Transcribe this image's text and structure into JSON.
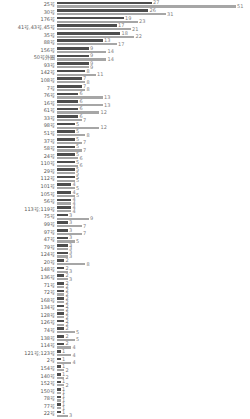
{
  "chart_data": {
    "type": "bar",
    "orientation": "horizontal",
    "title": "",
    "xlabel": "",
    "ylabel": "",
    "xlim": [
      0,
      55
    ],
    "grid": false,
    "legend": "none",
    "value_labels": true,
    "categories": [
      "25号",
      "30号",
      "176号",
      "41号,43号,45号",
      "35号",
      "88号",
      "156号",
      "50号外圈",
      "93号",
      "142号",
      "108号",
      "7号",
      "76号",
      "16号",
      "61号",
      "33号",
      "98号",
      "51号",
      "37号",
      "58号",
      "24号",
      "110号",
      "29号",
      "112号",
      "101号",
      "105号",
      "56号",
      "113号;119号",
      "75号",
      "99号",
      "97号",
      "47号",
      "79号",
      "124号",
      "20号",
      "148号",
      "136号",
      "71号",
      "72号",
      "168号",
      "134号",
      "128号",
      "126号",
      "74号",
      "138号",
      "114号",
      "121号;123号",
      "2号",
      "154号",
      "140号",
      "152号",
      "150号",
      "78号",
      "77号",
      "22号"
    ],
    "series": [
      {
        "name": "series-1-dark",
        "color": "#4d4d4d",
        "values": [
          27,
          26,
          19,
          17,
          18,
          13,
          9,
          9,
          9,
          8,
          7,
          7,
          6,
          6,
          6,
          6,
          5,
          5,
          5,
          5,
          5,
          5,
          5,
          5,
          4,
          4,
          4,
          4,
          3,
          3,
          3,
          3,
          3,
          3,
          2,
          2,
          2,
          2,
          2,
          2,
          2,
          2,
          2,
          2,
          2,
          2,
          1,
          1,
          1,
          1,
          1,
          1,
          1,
          1,
          1
        ]
      },
      {
        "name": "series-2-light",
        "color": "#a6a6a6",
        "values": [
          51,
          31,
          23,
          21,
          22,
          17,
          14,
          14,
          9,
          11,
          8,
          8,
          13,
          13,
          12,
          7,
          12,
          8,
          7,
          7,
          6,
          6,
          5,
          5,
          5,
          5,
          4,
          4,
          9,
          7,
          7,
          5,
          3,
          3,
          8,
          3,
          3,
          2,
          2,
          2,
          2,
          2,
          2,
          5,
          5,
          4,
          4,
          4,
          2,
          2,
          2,
          1,
          1,
          1,
          3
        ]
      }
    ],
    "label_color": "#7f7f7f",
    "category_label_color": "#595959",
    "background": "#ffffff",
    "px_per_unit": 3.5
  }
}
